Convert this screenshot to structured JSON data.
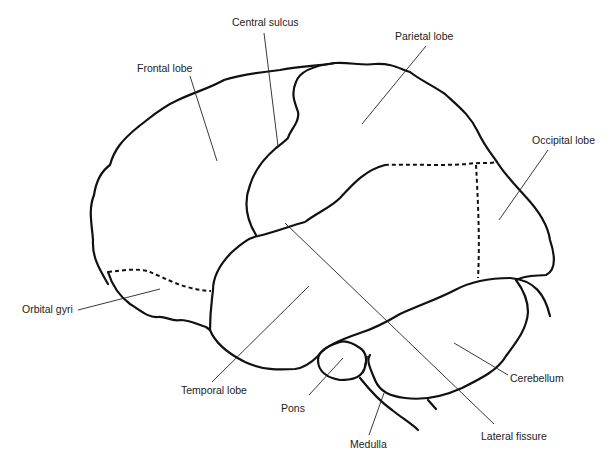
{
  "diagram": {
    "colors": {
      "outline": "#111111",
      "text": "#222222",
      "background": "#ffffff"
    },
    "labels": {
      "central_sulcus": "Central sulcus",
      "frontal_lobe": "Frontal lobe",
      "parietal_lobe": "Parietal lobe",
      "occipital_lobe": "Occipital lobe",
      "orbital_gyri": "Orbital gyri",
      "temporal_lobe": "Temporal lobe",
      "cerebellum": "Cerebellum",
      "pons": "Pons",
      "medulla": "Medulla",
      "lateral_fissure": "Lateral fissure"
    }
  }
}
